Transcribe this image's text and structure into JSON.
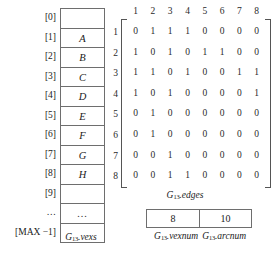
{
  "figure": {
    "graph_name": "G",
    "graph_subscript": "13"
  },
  "vexs_array": {
    "caption_prefix": "G",
    "caption_subscript": "13",
    "caption_suffix": ".vexs",
    "rows": [
      {
        "index": "[0]",
        "value": ""
      },
      {
        "index": "[1]",
        "value": "A"
      },
      {
        "index": "[2]",
        "value": "B"
      },
      {
        "index": "[3]",
        "value": "C"
      },
      {
        "index": "[4]",
        "value": "D"
      },
      {
        "index": "[5]",
        "value": "E"
      },
      {
        "index": "[6]",
        "value": "F"
      },
      {
        "index": "[7]",
        "value": "G"
      },
      {
        "index": "[8]",
        "value": "H"
      },
      {
        "index": "[9]",
        "value": ""
      },
      {
        "index": "…",
        "value": "…"
      },
      {
        "index": "[MAX −1]",
        "value": ""
      }
    ]
  },
  "edges_matrix": {
    "caption_prefix": "G",
    "caption_subscript": "13",
    "caption_suffix": ".edges",
    "col_headers": [
      "1",
      "2",
      "3",
      "4",
      "5",
      "6",
      "7",
      "8"
    ],
    "row_labels": [
      "1",
      "2",
      "3",
      "4",
      "5",
      "6",
      "7",
      "8"
    ],
    "rows": [
      [
        "0",
        "1",
        "1",
        "1",
        "0",
        "0",
        "0",
        "0"
      ],
      [
        "1",
        "0",
        "1",
        "0",
        "1",
        "1",
        "0",
        "0"
      ],
      [
        "1",
        "1",
        "0",
        "1",
        "0",
        "0",
        "1",
        "1"
      ],
      [
        "1",
        "0",
        "1",
        "0",
        "0",
        "0",
        "0",
        "1"
      ],
      [
        "0",
        "1",
        "0",
        "0",
        "0",
        "0",
        "0",
        "0"
      ],
      [
        "0",
        "1",
        "0",
        "0",
        "0",
        "0",
        "0",
        "0"
      ],
      [
        "0",
        "0",
        "1",
        "0",
        "0",
        "0",
        "0",
        "0"
      ],
      [
        "0",
        "0",
        "1",
        "1",
        "0",
        "0",
        "0",
        "0"
      ]
    ]
  },
  "counters": {
    "vexnum_value": "8",
    "arcnum_value": "10",
    "vexnum_caption_prefix": "G",
    "vexnum_caption_subscript": "13",
    "vexnum_caption_suffix": ".vexnum",
    "arcnum_caption_prefix": "G",
    "arcnum_caption_subscript": "13",
    "arcnum_caption_suffix": ".arcnum"
  },
  "chart_data": {
    "type": "table",
    "categories": [
      "1",
      "2",
      "3",
      "4",
      "5",
      "6",
      "7",
      "8"
    ],
    "series": [
      {
        "name": "1",
        "values": [
          0,
          1,
          1,
          1,
          0,
          0,
          0,
          0
        ]
      },
      {
        "name": "2",
        "values": [
          1,
          0,
          1,
          0,
          1,
          1,
          0,
          0
        ]
      },
      {
        "name": "3",
        "values": [
          1,
          1,
          0,
          1,
          0,
          0,
          1,
          1
        ]
      },
      {
        "name": "4",
        "values": [
          1,
          0,
          1,
          0,
          0,
          0,
          0,
          1
        ]
      },
      {
        "name": "5",
        "values": [
          0,
          1,
          0,
          0,
          0,
          0,
          0,
          0
        ]
      },
      {
        "name": "6",
        "values": [
          0,
          1,
          0,
          0,
          0,
          0,
          0,
          0
        ]
      },
      {
        "name": "7",
        "values": [
          0,
          0,
          1,
          0,
          0,
          0,
          0,
          0
        ]
      },
      {
        "name": "8",
        "values": [
          0,
          0,
          1,
          1,
          0,
          0,
          0,
          0
        ]
      }
    ],
    "vertices": [
      "A",
      "B",
      "C",
      "D",
      "E",
      "F",
      "G",
      "H"
    ],
    "vexnum": 8,
    "arcnum": 10,
    "xlabel": "",
    "ylabel": "",
    "grid": false,
    "legend": "none"
  }
}
